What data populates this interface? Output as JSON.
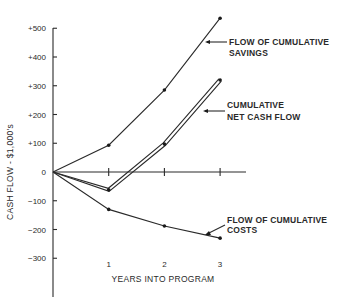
{
  "chart_data": {
    "type": "line",
    "title": "",
    "xlabel": "YEARS INTO PROGRAM",
    "ylabel": "CASH FLOW - $1,000's",
    "x": [
      0,
      1,
      2,
      3
    ],
    "x_tick_labels": [
      "1",
      "2",
      "3"
    ],
    "y_tick_labels": [
      "+500",
      "+400",
      "+300",
      "+200",
      "+100",
      "0",
      "−100",
      "−200",
      "−300"
    ],
    "y_ticks": [
      500,
      400,
      300,
      200,
      100,
      0,
      -100,
      -200,
      -300
    ],
    "ylim": [
      -400,
      520
    ],
    "xlim": [
      0,
      3.5
    ],
    "grid": false,
    "legend": "inline annotations with arrows",
    "series": [
      {
        "name": "FLOW OF CUMULATIVE SAVINGS",
        "label_lines": [
          "FLOW OF CUMULATIVE",
          "SAVINGS"
        ],
        "values": [
          0,
          93,
          285,
          535
        ],
        "style": "single"
      },
      {
        "name": "CUMULATIVE NET CASH FLOW",
        "label_lines": [
          "CUMULATIVE",
          "NET CASH FLOW"
        ],
        "values": [
          0,
          -62,
          97,
          320
        ],
        "style": "double"
      },
      {
        "name": "FLOW OF CUMULATIVE COSTS",
        "label_lines": [
          "FLOW OF CUMULATIVE",
          "COSTS"
        ],
        "values": [
          0,
          -130,
          -188,
          -230
        ],
        "style": "single"
      }
    ]
  }
}
